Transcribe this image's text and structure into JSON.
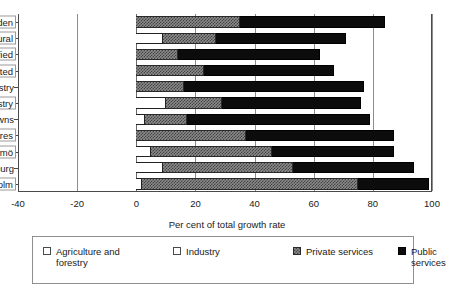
{
  "chart_data": {
    "type": "bar",
    "orientation": "horizontal",
    "stacked": true,
    "title": "",
    "xlabel": "Per cent of total growth rate",
    "ylabel": "",
    "xlim": [
      -40,
      100
    ],
    "xticks": [
      -40,
      -20,
      0,
      20,
      40,
      60,
      80,
      100
    ],
    "xtick_labels": [
      "-40",
      "-20",
      "0",
      "20",
      "40",
      "60",
      "80",
      "100"
    ],
    "grid": true,
    "legend_position": "bottom",
    "categories": [
      "Average Sweden",
      "Rural",
      "Small and diversified",
      "Sparsely populated",
      "Large scale industry",
      "Small scale industry",
      "One company towns",
      "Regional centres",
      "Malmö",
      "Gothenbourg",
      "Stockholm"
    ],
    "series": [
      {
        "name": "Agriculture and forestry",
        "color": "#ffffff",
        "values": [
          0,
          0,
          0,
          0,
          0,
          0,
          0,
          0,
          0,
          0,
          0
        ]
      },
      {
        "name": "Industry",
        "color": "#ffffff",
        "values": [
          0,
          9,
          0,
          0,
          0,
          10,
          3,
          0,
          5,
          9,
          2
        ]
      },
      {
        "name": "Private services",
        "color": "#8a8a8a",
        "values": [
          35,
          18,
          14,
          23,
          16,
          19,
          14,
          37,
          41,
          44,
          73
        ]
      },
      {
        "name": "Public services",
        "color": "#0c0c0c",
        "values": [
          49,
          44,
          48,
          44,
          61,
          47,
          62,
          50,
          41,
          41,
          24
        ]
      }
    ],
    "totals": [
      84,
      71,
      62,
      67,
      77,
      76,
      79,
      87,
      87,
      94,
      99
    ]
  },
  "legend": {
    "items": [
      {
        "label": "Agriculture and forestry",
        "swatch": "agri"
      },
      {
        "label": "Industry",
        "swatch": "ind"
      },
      {
        "label": "Private services",
        "swatch": "priv"
      },
      {
        "label": "Public services",
        "swatch": "pub"
      }
    ]
  },
  "axis": {
    "x_title": "Per cent of total growth rate"
  }
}
